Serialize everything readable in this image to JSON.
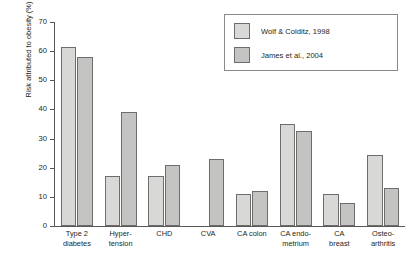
{
  "chart_data": {
    "type": "bar",
    "title": "",
    "xlabel": "",
    "ylabel": "Risk attributed to obesity (%)",
    "ylim": [
      0,
      70
    ],
    "yticks": [
      0,
      10,
      20,
      30,
      40,
      50,
      60,
      70
    ],
    "ytick_labels": [
      "0",
      "10",
      "20",
      "30",
      "40",
      "50",
      "60",
      "70"
    ],
    "grid": false,
    "legend_position": "top-right",
    "categories": [
      "Type 2 diabetes",
      "Hypertension",
      "CHD",
      "CVA",
      "CA colon",
      "CA endometrium",
      "CA breast",
      "Osteoarthritis"
    ],
    "category_label_lines": [
      [
        "Type 2",
        "diabetes"
      ],
      [
        "Hyper-",
        "tension"
      ],
      [
        "CHD"
      ],
      [
        "CVA"
      ],
      [
        "CA colon"
      ],
      [
        "CA endo-",
        "metrium"
      ],
      [
        "CA",
        "breast"
      ],
      [
        "Osteo-",
        "arthritis"
      ]
    ],
    "series": [
      {
        "name": "Wolf & Colditz, 1998",
        "color": "#d8d8d6",
        "values": [
          61.5,
          17,
          17,
          null,
          11,
          35,
          11,
          24.5
        ]
      },
      {
        "name": "James et al., 2004",
        "color": "#c3c3c1",
        "values": [
          58,
          39,
          21,
          23,
          12,
          32.5,
          8,
          13
        ]
      }
    ]
  },
  "legend": {
    "entries": [
      {
        "label": "Wolf & Colditz, 1998",
        "swatch": "series-1-swatch"
      },
      {
        "label": "James et al., 2004",
        "swatch": "series-2-swatch"
      }
    ]
  },
  "axis": {
    "y_title": "Risk attributed to obesity (%)"
  }
}
